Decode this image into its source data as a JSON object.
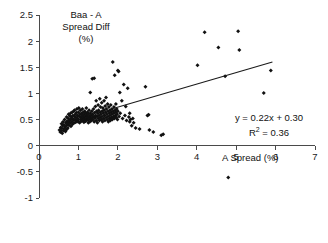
{
  "chart_data": {
    "type": "scatter",
    "title": "",
    "ylabel": "Baa - A Spread Diff (%)",
    "ylabel_lines": [
      "Baa - A",
      "Spread Diff",
      "(%)"
    ],
    "xlabel": "A Spread (%)",
    "xlim": [
      0,
      7
    ],
    "ylim": [
      -1,
      2.5
    ],
    "xticks": [
      0,
      1,
      2,
      3,
      4,
      5,
      6,
      7
    ],
    "xtick_labels": [
      "0",
      "1",
      "2",
      "3",
      "4",
      "5",
      "6",
      "7"
    ],
    "yticks": [
      -1,
      -0.5,
      0,
      0.5,
      1,
      1.5,
      2,
      2.5
    ],
    "ytick_labels": [
      "-1",
      "-0.5",
      "0",
      "0.5",
      "1",
      "1.5",
      "2",
      "2.5"
    ],
    "grid": false,
    "legend": null,
    "annotations": {
      "equation": "y = 0.22x + 0.30",
      "r_squared_prefix": "R",
      "r_squared_sup": "2",
      "r_squared_value": " = 0.36",
      "r_squared_full": "R² = 0.36"
    },
    "fit_line": {
      "slope": 0.22,
      "intercept": 0.3,
      "x_start": 1.88,
      "x_end": 5.92,
      "y_start": 0.71,
      "y_end": 1.6
    },
    "series": [
      {
        "name": "Baa - A spread difference vs A spread",
        "marker": "diamond",
        "color": "#111111",
        "points": [
          [
            0.52,
            0.3
          ],
          [
            0.54,
            0.26
          ],
          [
            0.55,
            0.35
          ],
          [
            0.56,
            0.28
          ],
          [
            0.57,
            0.42
          ],
          [
            0.58,
            0.33
          ],
          [
            0.59,
            0.24
          ],
          [
            0.6,
            0.38
          ],
          [
            0.61,
            0.46
          ],
          [
            0.62,
            0.29
          ],
          [
            0.63,
            0.4
          ],
          [
            0.64,
            0.33
          ],
          [
            0.65,
            0.5
          ],
          [
            0.66,
            0.36
          ],
          [
            0.67,
            0.27
          ],
          [
            0.68,
            0.44
          ],
          [
            0.69,
            0.38
          ],
          [
            0.7,
            0.55
          ],
          [
            0.7,
            0.31
          ],
          [
            0.71,
            0.47
          ],
          [
            0.72,
            0.41
          ],
          [
            0.73,
            0.34
          ],
          [
            0.74,
            0.52
          ],
          [
            0.75,
            0.45
          ],
          [
            0.75,
            0.6
          ],
          [
            0.76,
            0.39
          ],
          [
            0.77,
            0.48
          ],
          [
            0.78,
            0.57
          ],
          [
            0.79,
            0.43
          ],
          [
            0.8,
            0.62
          ],
          [
            0.8,
            0.5
          ],
          [
            0.81,
            0.37
          ],
          [
            0.82,
            0.55
          ],
          [
            0.83,
            0.46
          ],
          [
            0.84,
            0.64
          ],
          [
            0.85,
            0.52
          ],
          [
            0.85,
            0.41
          ],
          [
            0.86,
            0.58
          ],
          [
            0.87,
            0.49
          ],
          [
            0.88,
            0.66
          ],
          [
            0.89,
            0.44
          ],
          [
            0.9,
            0.56
          ],
          [
            0.9,
            0.68
          ],
          [
            0.91,
            0.5
          ],
          [
            0.92,
            0.6
          ],
          [
            0.93,
            0.45
          ],
          [
            0.94,
            0.54
          ],
          [
            0.95,
            0.63
          ],
          [
            0.95,
            0.48
          ],
          [
            0.96,
            0.7
          ],
          [
            0.97,
            0.52
          ],
          [
            0.98,
            0.58
          ],
          [
            0.99,
            0.46
          ],
          [
            1.0,
            0.64
          ],
          [
            1.0,
            0.5
          ],
          [
            1.01,
            0.72
          ],
          [
            1.02,
            0.56
          ],
          [
            1.03,
            0.44
          ],
          [
            1.04,
            0.6
          ],
          [
            1.05,
            0.5
          ],
          [
            1.05,
            0.68
          ],
          [
            1.06,
            0.55
          ],
          [
            1.07,
            0.47
          ],
          [
            1.08,
            0.62
          ],
          [
            1.09,
            0.52
          ],
          [
            1.1,
            0.58
          ],
          [
            1.1,
            0.7
          ],
          [
            1.11,
            0.48
          ],
          [
            1.12,
            0.64
          ],
          [
            1.13,
            0.54
          ],
          [
            1.14,
            0.45
          ],
          [
            1.15,
            0.6
          ],
          [
            1.15,
            0.5
          ],
          [
            1.16,
            0.66
          ],
          [
            1.17,
            0.56
          ],
          [
            1.18,
            0.47
          ],
          [
            1.19,
            0.62
          ],
          [
            1.2,
            0.52
          ],
          [
            1.2,
            0.72
          ],
          [
            1.21,
            0.58
          ],
          [
            1.22,
            0.49
          ],
          [
            1.23,
            0.64
          ],
          [
            1.24,
            0.55
          ],
          [
            1.25,
            0.44
          ],
          [
            1.25,
            0.6
          ],
          [
            1.26,
            0.5
          ],
          [
            1.27,
            0.68
          ],
          [
            1.28,
            0.56
          ],
          [
            1.29,
            0.46
          ],
          [
            1.3,
            0.62
          ],
          [
            1.3,
            1.02
          ],
          [
            1.31,
            0.52
          ],
          [
            1.32,
            0.58
          ],
          [
            1.33,
            0.48
          ],
          [
            1.34,
            0.66
          ],
          [
            1.35,
            0.54
          ],
          [
            1.35,
            1.28
          ],
          [
            1.36,
            0.6
          ],
          [
            1.37,
            0.5
          ],
          [
            1.38,
            0.7
          ],
          [
            1.39,
            0.56
          ],
          [
            1.4,
            0.46
          ],
          [
            1.4,
            1.29
          ],
          [
            1.41,
            0.63
          ],
          [
            1.42,
            0.53
          ],
          [
            1.43,
            0.75
          ],
          [
            1.44,
            0.58
          ],
          [
            1.45,
            0.48
          ],
          [
            1.45,
            0.86
          ],
          [
            1.46,
            0.66
          ],
          [
            1.47,
            0.56
          ],
          [
            1.48,
            0.44
          ],
          [
            1.49,
            0.62
          ],
          [
            1.5,
            0.52
          ],
          [
            1.5,
            0.78
          ],
          [
            1.51,
            0.68
          ],
          [
            1.52,
            0.58
          ],
          [
            1.53,
            0.48
          ],
          [
            1.54,
            0.9
          ],
          [
            1.55,
            0.64
          ],
          [
            1.55,
            0.54
          ],
          [
            1.56,
            0.74
          ],
          [
            1.57,
            0.6
          ],
          [
            1.58,
            0.5
          ],
          [
            1.59,
            0.82
          ],
          [
            1.6,
            0.66
          ],
          [
            1.6,
            0.56
          ],
          [
            1.61,
            0.46
          ],
          [
            1.62,
            0.72
          ],
          [
            1.63,
            0.62
          ],
          [
            1.64,
            0.52
          ],
          [
            1.65,
            0.86
          ],
          [
            1.65,
            0.68
          ],
          [
            1.66,
            0.58
          ],
          [
            1.67,
            0.48
          ],
          [
            1.68,
            0.76
          ],
          [
            1.69,
            0.64
          ],
          [
            1.7,
            0.54
          ],
          [
            1.7,
            0.92
          ],
          [
            1.71,
            0.7
          ],
          [
            1.72,
            0.6
          ],
          [
            1.73,
            0.5
          ],
          [
            1.74,
            0.8
          ],
          [
            1.75,
            0.66
          ],
          [
            1.75,
            0.56
          ],
          [
            1.76,
            0.46
          ],
          [
            1.77,
            0.74
          ],
          [
            1.78,
            0.62
          ],
          [
            1.79,
            0.52
          ],
          [
            1.8,
            0.68
          ],
          [
            1.8,
            0.58
          ],
          [
            1.81,
            0.48
          ],
          [
            1.82,
            0.78
          ],
          [
            1.83,
            0.64
          ],
          [
            1.84,
            0.54
          ],
          [
            1.85,
            0.7
          ],
          [
            1.85,
            0.6
          ],
          [
            1.86,
            0.5
          ],
          [
            1.87,
            1.6
          ],
          [
            1.88,
            0.66
          ],
          [
            1.89,
            0.56
          ],
          [
            1.9,
            0.74
          ],
          [
            1.9,
            0.62
          ],
          [
            1.91,
            0.52
          ],
          [
            1.92,
            1.35
          ],
          [
            1.93,
            0.68
          ],
          [
            1.94,
            0.58
          ],
          [
            1.95,
            0.8
          ],
          [
            1.95,
            0.64
          ],
          [
            1.96,
            0.54
          ],
          [
            1.97,
            0.7
          ],
          [
            1.98,
            0.6
          ],
          [
            1.99,
            0.5
          ],
          [
            2.0,
            1.44
          ],
          [
            2.0,
            0.66
          ],
          [
            2.02,
            1.42
          ],
          [
            2.03,
            0.56
          ],
          [
            2.05,
            1.02
          ],
          [
            2.06,
            0.62
          ],
          [
            2.1,
            0.86
          ],
          [
            2.12,
            0.52
          ],
          [
            2.15,
            1.17
          ],
          [
            2.18,
            0.58
          ],
          [
            2.2,
            0.75
          ],
          [
            2.22,
            0.48
          ],
          [
            2.25,
            1.1
          ],
          [
            2.28,
            0.55
          ],
          [
            2.3,
            0.62
          ],
          [
            2.3,
            0.46
          ],
          [
            2.32,
            0.5
          ],
          [
            2.35,
            0.38
          ],
          [
            2.38,
            0.52
          ],
          [
            2.4,
            0.44
          ],
          [
            2.45,
            0.34
          ],
          [
            2.55,
            0.32
          ],
          [
            2.7,
            1.13
          ],
          [
            2.75,
            0.58
          ],
          [
            2.8,
            0.3
          ],
          [
            2.9,
            0.26
          ],
          [
            3.1,
            0.2
          ],
          [
            3.15,
            0.22
          ],
          [
            2.78,
            0.59
          ],
          [
            4.02,
            1.54
          ],
          [
            4.2,
            2.17
          ],
          [
            4.55,
            1.88
          ],
          [
            4.72,
            1.33
          ],
          [
            4.8,
            -0.61
          ],
          [
            5.05,
            2.19
          ],
          [
            5.08,
            1.83
          ],
          [
            5.7,
            1.01
          ],
          [
            5.88,
            1.44
          ]
        ]
      }
    ]
  }
}
